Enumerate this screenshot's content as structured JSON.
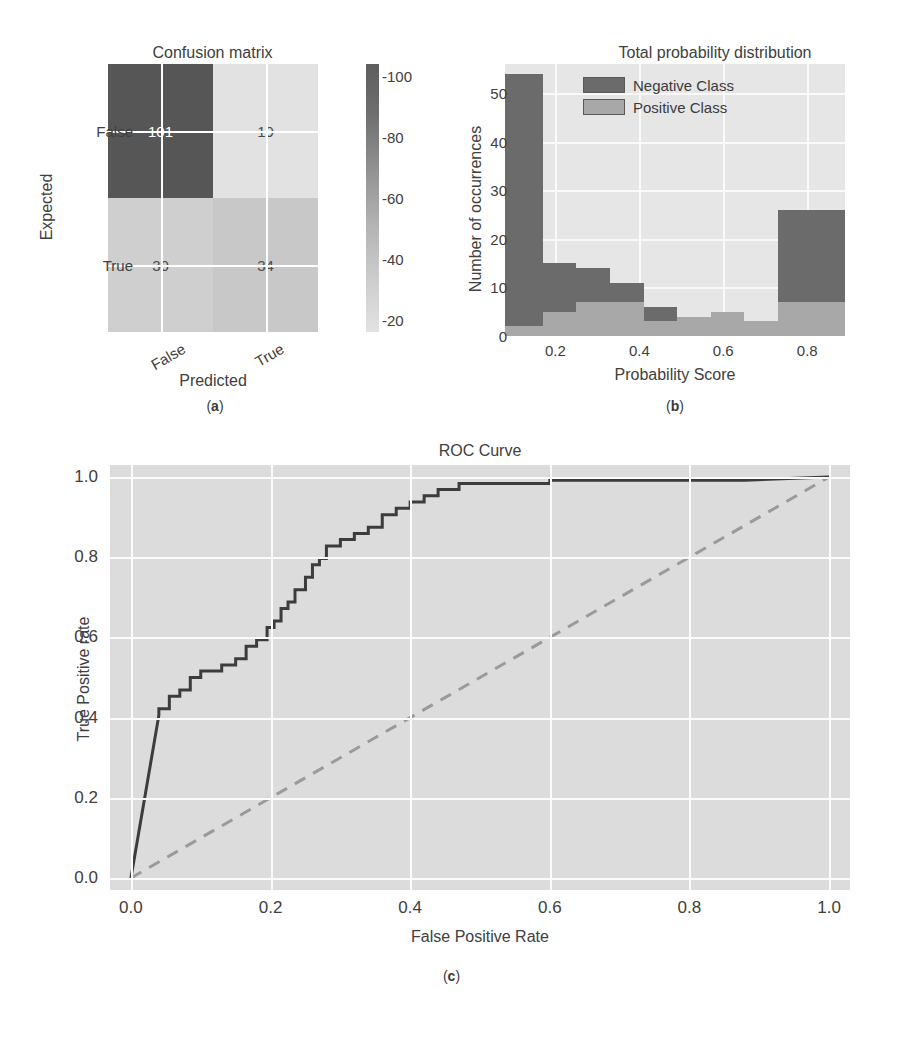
{
  "figure": {
    "panel_labels": {
      "a": "(a)",
      "b": "(b)",
      "c": "(c)"
    }
  },
  "chart_data": [
    {
      "type": "heatmap",
      "id": "confusion-matrix",
      "title": "Confusion matrix",
      "xlabel": "Predicted",
      "ylabel": "Expected",
      "xticklabels": [
        "False",
        "True"
      ],
      "yticklabels": [
        "False",
        "True"
      ],
      "matrix": [
        [
          101,
          19
        ],
        [
          30,
          34
        ]
      ],
      "cell_labels": [
        "101",
        "19",
        "30",
        "34"
      ],
      "colorbar": {
        "ticks": [
          20,
          40,
          60,
          80,
          100
        ],
        "ticklabels": [
          "20",
          "40",
          "60",
          "80",
          "100"
        ],
        "vmin": 19,
        "vmax": 101,
        "cmap": "gray-sequential"
      },
      "colors": {
        "cell_high": "#555555",
        "cell_mid": "#b0b0b0",
        "cell_low": "#d9d9d9",
        "gridline": "#ffffff",
        "text_on_dark": "#ffffff",
        "text_on_light": "#4a4a4a"
      }
    },
    {
      "type": "bar",
      "id": "probability-histogram",
      "title": "Total probability distribution",
      "xlabel": "Probability Score",
      "ylabel": "Number of occurrences",
      "xlim": [
        0.08,
        0.89
      ],
      "ylim": [
        0,
        56
      ],
      "xticks": [
        0.2,
        0.4,
        0.6,
        0.8
      ],
      "xticklabels": [
        "0.2",
        "0.4",
        "0.6",
        "0.8"
      ],
      "yticks": [
        0,
        10,
        20,
        30,
        40,
        50
      ],
      "yticklabels": [
        "0",
        "10",
        "20",
        "30",
        "40",
        "50"
      ],
      "legend_position": "upper center",
      "bin_edges": [
        0.08,
        0.17,
        0.25,
        0.33,
        0.41,
        0.49,
        0.57,
        0.65,
        0.73,
        0.81,
        0.89
      ],
      "series": [
        {
          "name": "Negative Class",
          "color": "#6b6b6b",
          "values": [
            54,
            15,
            14,
            11,
            6,
            4,
            5,
            3,
            26,
            26
          ]
        },
        {
          "name": "Positive Class",
          "color": "#a8a8a8",
          "values": [
            2,
            5,
            7,
            7,
            3,
            4,
            5,
            3,
            7,
            7
          ]
        }
      ],
      "grid": true,
      "background": "#e6e6e6"
    },
    {
      "type": "line",
      "id": "roc-curve",
      "title": "ROC Curve",
      "xlabel": "False Positive Rate",
      "ylabel": "True Positive rate",
      "xlim": [
        -0.03,
        1.03
      ],
      "ylim": [
        -0.03,
        1.03
      ],
      "xticks": [
        0.0,
        0.2,
        0.4,
        0.6,
        0.8,
        1.0
      ],
      "xticklabels": [
        "0.0",
        "0.2",
        "0.4",
        "0.6",
        "0.8",
        "1.0"
      ],
      "yticks": [
        0.0,
        0.2,
        0.4,
        0.6,
        0.8,
        1.0
      ],
      "yticklabels": [
        "0.0",
        "0.2",
        "0.4",
        "0.6",
        "0.8",
        "1.0"
      ],
      "grid": true,
      "background": "#dcdcdc",
      "series": [
        {
          "name": "ROC",
          "style": "solid",
          "color": "#3c3c3c",
          "points": [
            [
              0.0,
              0.0
            ],
            [
              0.04,
              0.406
            ],
            [
              0.04,
              0.422
            ],
            [
              0.055,
              0.422
            ],
            [
              0.055,
              0.453
            ],
            [
              0.07,
              0.453
            ],
            [
              0.07,
              0.469
            ],
            [
              0.085,
              0.469
            ],
            [
              0.085,
              0.5
            ],
            [
              0.1,
              0.5
            ],
            [
              0.1,
              0.516
            ],
            [
              0.13,
              0.516
            ],
            [
              0.13,
              0.531
            ],
            [
              0.15,
              0.531
            ],
            [
              0.15,
              0.547
            ],
            [
              0.165,
              0.547
            ],
            [
              0.165,
              0.578
            ],
            [
              0.18,
              0.578
            ],
            [
              0.18,
              0.594
            ],
            [
              0.195,
              0.594
            ],
            [
              0.195,
              0.625
            ],
            [
              0.205,
              0.625
            ],
            [
              0.205,
              0.641
            ],
            [
              0.215,
              0.641
            ],
            [
              0.215,
              0.672
            ],
            [
              0.225,
              0.672
            ],
            [
              0.225,
              0.688
            ],
            [
              0.235,
              0.688
            ],
            [
              0.235,
              0.719
            ],
            [
              0.25,
              0.719
            ],
            [
              0.25,
              0.75
            ],
            [
              0.26,
              0.75
            ],
            [
              0.26,
              0.781
            ],
            [
              0.27,
              0.781
            ],
            [
              0.27,
              0.797
            ],
            [
              0.28,
              0.797
            ],
            [
              0.28,
              0.828
            ],
            [
              0.3,
              0.828
            ],
            [
              0.3,
              0.844
            ],
            [
              0.32,
              0.844
            ],
            [
              0.32,
              0.859
            ],
            [
              0.34,
              0.859
            ],
            [
              0.34,
              0.875
            ],
            [
              0.36,
              0.875
            ],
            [
              0.36,
              0.906
            ],
            [
              0.38,
              0.906
            ],
            [
              0.38,
              0.922
            ],
            [
              0.4,
              0.922
            ],
            [
              0.4,
              0.938
            ],
            [
              0.42,
              0.938
            ],
            [
              0.42,
              0.953
            ],
            [
              0.44,
              0.953
            ],
            [
              0.44,
              0.969
            ],
            [
              0.47,
              0.969
            ],
            [
              0.47,
              0.984
            ],
            [
              0.6,
              0.984
            ],
            [
              0.6,
              0.992
            ],
            [
              0.88,
              0.992
            ],
            [
              1.0,
              1.0
            ]
          ]
        },
        {
          "name": "Chance",
          "style": "dashed",
          "color": "#9a9a9a",
          "points": [
            [
              0.0,
              0.0
            ],
            [
              1.0,
              1.0
            ]
          ]
        }
      ]
    }
  ]
}
